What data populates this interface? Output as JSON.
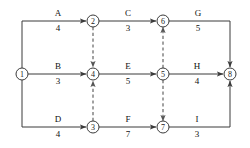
{
  "diagram": {
    "type": "activity-on-arrow-network",
    "title": "",
    "canvas": {
      "width": 250,
      "height": 148
    },
    "colors": {
      "background": "#ffffff",
      "stroke": "#3a3a3a",
      "dummy_stroke": "#555555",
      "text": "#111111"
    },
    "nodes": [
      {
        "id": "1",
        "label": "1",
        "cx": 22,
        "cy": 74,
        "r": 6
      },
      {
        "id": "2",
        "label": "2",
        "cx": 93,
        "cy": 21,
        "r": 6
      },
      {
        "id": "3",
        "label": "3",
        "cx": 93,
        "cy": 127,
        "r": 6
      },
      {
        "id": "4",
        "label": "4",
        "cx": 93,
        "cy": 74,
        "r": 6
      },
      {
        "id": "5",
        "label": "5",
        "cx": 163,
        "cy": 74,
        "r": 6
      },
      {
        "id": "6",
        "label": "6",
        "cx": 163,
        "cy": 21,
        "r": 6
      },
      {
        "id": "7",
        "label": "7",
        "cx": 163,
        "cy": 127,
        "r": 6
      },
      {
        "id": "8",
        "label": "8",
        "cx": 230,
        "cy": 74,
        "r": 6
      }
    ],
    "activities": [
      {
        "name": "A",
        "duration": "4",
        "from": "1",
        "to": "2",
        "style": "solid",
        "label_x": 58,
        "name_y": 16,
        "dur_y": 31
      },
      {
        "name": "C",
        "duration": "3",
        "from": "2",
        "to": "6",
        "style": "solid",
        "label_x": 128,
        "name_y": 16,
        "dur_y": 31
      },
      {
        "name": "G",
        "duration": "5",
        "from": "6",
        "to": "8",
        "style": "solid",
        "label_x": 198,
        "name_y": 16,
        "dur_y": 31
      },
      {
        "name": "B",
        "duration": "3",
        "from": "1",
        "to": "4",
        "style": "solid",
        "label_x": 58,
        "name_y": 69,
        "dur_y": 84
      },
      {
        "name": "E",
        "duration": "5",
        "from": "4",
        "to": "5",
        "style": "solid",
        "label_x": 128,
        "name_y": 69,
        "dur_y": 84
      },
      {
        "name": "H",
        "duration": "4",
        "from": "5",
        "to": "8",
        "style": "solid",
        "label_x": 197,
        "name_y": 69,
        "dur_y": 84
      },
      {
        "name": "D",
        "duration": "4",
        "from": "1",
        "to": "3",
        "style": "solid",
        "label_x": 58,
        "name_y": 122,
        "dur_y": 137
      },
      {
        "name": "F",
        "duration": "7",
        "from": "3",
        "to": "7",
        "style": "solid",
        "label_x": 128,
        "name_y": 122,
        "dur_y": 137
      },
      {
        "name": "I",
        "duration": "3",
        "from": "7",
        "to": "8",
        "style": "solid",
        "label_x": 197,
        "name_y": 122,
        "dur_y": 137
      }
    ],
    "dummies": [
      {
        "from": "2",
        "to": "4",
        "style": "dashed",
        "direction": "down"
      },
      {
        "from": "3",
        "to": "4",
        "style": "dashed",
        "direction": "up"
      },
      {
        "from": "5",
        "to": "6",
        "style": "dashed",
        "direction": "up"
      },
      {
        "from": "5",
        "to": "7",
        "style": "dashed",
        "direction": "down"
      }
    ]
  }
}
